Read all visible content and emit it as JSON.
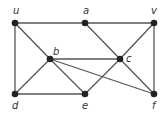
{
  "graph": {
    "nodes": [
      {
        "id": "u",
        "label": "u",
        "x": 15,
        "y": 23,
        "lx": 13,
        "ly": 14
      },
      {
        "id": "a",
        "label": "a",
        "x": 85,
        "y": 23,
        "lx": 83,
        "ly": 14
      },
      {
        "id": "v",
        "label": "v",
        "x": 154,
        "y": 23,
        "lx": 151,
        "ly": 14
      },
      {
        "id": "b",
        "label": "b",
        "x": 50,
        "y": 59,
        "lx": 53,
        "ly": 55
      },
      {
        "id": "c",
        "label": "c",
        "x": 120,
        "y": 59,
        "lx": 126,
        "ly": 62
      },
      {
        "id": "d",
        "label": "d",
        "x": 15,
        "y": 94,
        "lx": 12,
        "ly": 109
      },
      {
        "id": "e",
        "label": "e",
        "x": 85,
        "y": 94,
        "lx": 82,
        "ly": 109
      },
      {
        "id": "f",
        "label": "f",
        "x": 154,
        "y": 94,
        "lx": 152,
        "ly": 109
      }
    ],
    "edges": [
      [
        "u",
        "a"
      ],
      [
        "a",
        "v"
      ],
      [
        "u",
        "d"
      ],
      [
        "u",
        "b"
      ],
      [
        "a",
        "c"
      ],
      [
        "v",
        "c"
      ],
      [
        "v",
        "f"
      ],
      [
        "b",
        "c"
      ],
      [
        "b",
        "d"
      ],
      [
        "b",
        "e"
      ],
      [
        "b",
        "f"
      ],
      [
        "c",
        "e"
      ],
      [
        "c",
        "f"
      ],
      [
        "d",
        "e"
      ]
    ],
    "colors": {
      "edge": "#555555",
      "node": "#222222",
      "label": "#333333"
    }
  }
}
